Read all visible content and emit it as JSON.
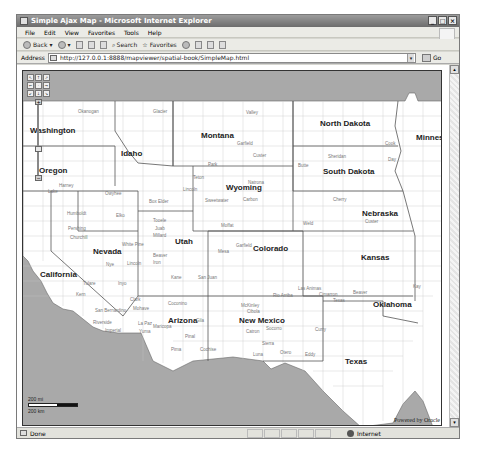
{
  "window": {
    "title": "Simple Ajax Map - Microsoft Internet Explorer",
    "controls": [
      "_",
      "□",
      "×"
    ]
  },
  "menu": [
    "File",
    "Edit",
    "View",
    "Favorites",
    "Tools",
    "Help"
  ],
  "toolbar": {
    "back_label": "Back",
    "search_label": "Search",
    "favorites_label": "Favorites"
  },
  "address": {
    "label": "Address",
    "url": "http://127.0.0.1:8888/mapviewer/spatial-book/SimpleMap.html",
    "go_label": "Go"
  },
  "map": {
    "states": [
      {
        "name": "Washington",
        "x": 7,
        "y": 55
      },
      {
        "name": "Oregon",
        "x": 16,
        "y": 95
      },
      {
        "name": "Idaho",
        "x": 98,
        "y": 78
      },
      {
        "name": "Montana",
        "x": 178,
        "y": 60
      },
      {
        "name": "North Dakota",
        "x": 297,
        "y": 48
      },
      {
        "name": "Minnesota",
        "x": 393,
        "y": 62
      },
      {
        "name": "South Dakota",
        "x": 300,
        "y": 96
      },
      {
        "name": "Wyoming",
        "x": 203,
        "y": 112
      },
      {
        "name": "Nebraska",
        "x": 339,
        "y": 138
      },
      {
        "name": "Nevada",
        "x": 70,
        "y": 176
      },
      {
        "name": "Utah",
        "x": 152,
        "y": 166
      },
      {
        "name": "Colorado",
        "x": 230,
        "y": 173
      },
      {
        "name": "Kansas",
        "x": 338,
        "y": 182
      },
      {
        "name": "California",
        "x": 17,
        "y": 199
      },
      {
        "name": "Oklahoma",
        "x": 350,
        "y": 229
      },
      {
        "name": "Arizona",
        "x": 145,
        "y": 245
      },
      {
        "name": "New Mexico",
        "x": 216,
        "y": 245
      },
      {
        "name": "Texas",
        "x": 322,
        "y": 286
      }
    ],
    "counties": [
      {
        "name": "Okanogan",
        "x": 55,
        "y": 38
      },
      {
        "name": "Glacier",
        "x": 130,
        "y": 38
      },
      {
        "name": "Valley",
        "x": 223,
        "y": 39
      },
      {
        "name": "Garfield",
        "x": 214,
        "y": 58
      },
      {
        "name": "Custer",
        "x": 230,
        "y": 75
      },
      {
        "name": "Park",
        "x": 185,
        "y": 91
      },
      {
        "name": "Teton",
        "x": 170,
        "y": 104
      },
      {
        "name": "Butte",
        "x": 275,
        "y": 92
      },
      {
        "name": "Harney",
        "x": 36,
        "y": 112
      },
      {
        "name": "Lake",
        "x": 25,
        "y": 118
      },
      {
        "name": "Owyhee",
        "x": 82,
        "y": 120
      },
      {
        "name": "Sweetwater",
        "x": 182,
        "y": 127
      },
      {
        "name": "Carbon",
        "x": 220,
        "y": 126
      },
      {
        "name": "Lincoln",
        "x": 160,
        "y": 116
      },
      {
        "name": "Natrona",
        "x": 225,
        "y": 109
      },
      {
        "name": "Box Elder",
        "x": 126,
        "y": 128
      },
      {
        "name": "Humboldt",
        "x": 44,
        "y": 140
      },
      {
        "name": "Elko",
        "x": 93,
        "y": 142
      },
      {
        "name": "Pershing",
        "x": 45,
        "y": 155
      },
      {
        "name": "Churchill",
        "x": 47,
        "y": 164
      },
      {
        "name": "White Pine",
        "x": 99,
        "y": 171
      },
      {
        "name": "Nye",
        "x": 83,
        "y": 191
      },
      {
        "name": "Lincoln",
        "x": 104,
        "y": 190
      },
      {
        "name": "Tooele",
        "x": 130,
        "y": 147
      },
      {
        "name": "Juab",
        "x": 132,
        "y": 161
      },
      {
        "name": "Millard",
        "x": 130,
        "y": 168
      },
      {
        "name": "Beaver",
        "x": 130,
        "y": 185
      },
      {
        "name": "Iron",
        "x": 130,
        "y": 192
      },
      {
        "name": "Moffat",
        "x": 180,
        "y": 152
      },
      {
        "name": "Weld",
        "x": 280,
        "y": 150
      },
      {
        "name": "Garfield",
        "x": 166,
        "y": 172
      },
      {
        "name": "Mesa",
        "x": 179,
        "y": 177
      },
      {
        "name": "Kane",
        "x": 148,
        "y": 204
      },
      {
        "name": "San Juan",
        "x": 175,
        "y": 204
      },
      {
        "name": "Inyo",
        "x": 95,
        "y": 210
      },
      {
        "name": "Kern",
        "x": 53,
        "y": 221
      },
      {
        "name": "Tulare",
        "x": 60,
        "y": 210
      },
      {
        "name": "Clark",
        "x": 107,
        "y": 228
      },
      {
        "name": "Mohave",
        "x": 110,
        "y": 235
      },
      {
        "name": "Coconino",
        "x": 145,
        "y": 230
      },
      {
        "name": "San Bernardino",
        "x": 72,
        "y": 237
      },
      {
        "name": "Riverside",
        "x": 70,
        "y": 249
      },
      {
        "name": "Imperial",
        "x": 82,
        "y": 257
      },
      {
        "name": "La Paz",
        "x": 115,
        "y": 250
      },
      {
        "name": "Yuma",
        "x": 116,
        "y": 258
      },
      {
        "name": "Maricopa",
        "x": 130,
        "y": 253
      },
      {
        "name": "Gila",
        "x": 173,
        "y": 247
      },
      {
        "name": "Pinal",
        "x": 162,
        "y": 263
      },
      {
        "name": "Pima",
        "x": 148,
        "y": 276
      },
      {
        "name": "Cochise",
        "x": 177,
        "y": 276
      },
      {
        "name": "McKinley",
        "x": 218,
        "y": 232
      },
      {
        "name": "Cibola",
        "x": 224,
        "y": 238
      },
      {
        "name": "Catron",
        "x": 223,
        "y": 258
      },
      {
        "name": "Socorro",
        "x": 243,
        "y": 255
      },
      {
        "name": "Sierra",
        "x": 239,
        "y": 270
      },
      {
        "name": "Otero",
        "x": 257,
        "y": 279
      },
      {
        "name": "Eddy",
        "x": 282,
        "y": 281
      },
      {
        "name": "Luna",
        "x": 230,
        "y": 281
      },
      {
        "name": "Rio Arriba",
        "x": 250,
        "y": 222
      },
      {
        "name": "Las Animas",
        "x": 295,
        "y": 215
      },
      {
        "name": "Cimarron",
        "x": 316,
        "y": 221
      },
      {
        "name": "Texas",
        "x": 325,
        "y": 225
      },
      {
        "name": "Curry",
        "x": 292,
        "y": 256
      },
      {
        "name": "Cook",
        "x": 362,
        "y": 70
      },
      {
        "name": "Sheridan",
        "x": 325,
        "y": 83
      },
      {
        "name": "Day",
        "x": 365,
        "y": 86
      },
      {
        "name": "Cherry",
        "x": 330,
        "y": 126
      },
      {
        "name": "Custer",
        "x": 342,
        "y": 148
      },
      {
        "name": "Beaver",
        "x": 330,
        "y": 219
      },
      {
        "name": "Kay",
        "x": 390,
        "y": 213
      }
    ],
    "scale": {
      "top_label": "200 mi",
      "bottom_label": "200 km"
    },
    "attribution": "Powered by Oracle",
    "nav_buttons": [
      "↖",
      "↑",
      "↗",
      "←",
      "·",
      "→",
      "↙",
      "↓",
      "↘"
    ],
    "zoom_in": "+",
    "zoom_out": "−",
    "colors": {
      "ocean": "#a9a9a9",
      "land": "#ffffff",
      "county_border": "#b5b5b5",
      "state_border": "#555555"
    }
  },
  "status": {
    "text": "Done",
    "zone": "Internet"
  }
}
